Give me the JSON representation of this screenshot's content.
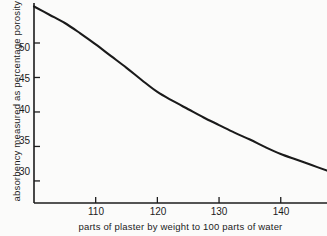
{
  "chart_data": {
    "type": "line",
    "title": "",
    "subtitle": "",
    "xlabel": "parts of plaster by weight to 100 parts of water",
    "ylabel": "absorbency measured as percentage porosity",
    "xlim": [
      100,
      147.5
    ],
    "ylim": [
      26.8,
      55.8
    ],
    "xticks": [
      110,
      120,
      130,
      140
    ],
    "xtick_labels": [
      "110",
      "120",
      "130",
      "140"
    ],
    "yticks": [
      30,
      35,
      40,
      45,
      50
    ],
    "ytick_labels": [
      "30",
      "35",
      "40",
      "45",
      "50"
    ],
    "grid": false,
    "legend": false,
    "legend_position": "none",
    "line_color": "#1a1a1a",
    "line_width": 2.1,
    "series": [
      {
        "name": "absorbency",
        "x": [
          100,
          102.5,
          105,
          107.5,
          110,
          112.5,
          115,
          117.5,
          120,
          122.5,
          125,
          127.5,
          130,
          132.5,
          135,
          137.5,
          140,
          142.5,
          145,
          147.5
        ],
        "values": [
          55.3,
          54.1,
          52.9,
          51.4,
          49.8,
          48.1,
          46.4,
          44.6,
          42.9,
          41.6,
          40.4,
          39.2,
          38.1,
          37.0,
          36.0,
          34.9,
          33.9,
          33.1,
          32.3,
          31.5
        ]
      }
    ],
    "annotations": []
  },
  "axes": {
    "y_axis_name": "y-axis",
    "x_axis_name": "x-axis"
  }
}
